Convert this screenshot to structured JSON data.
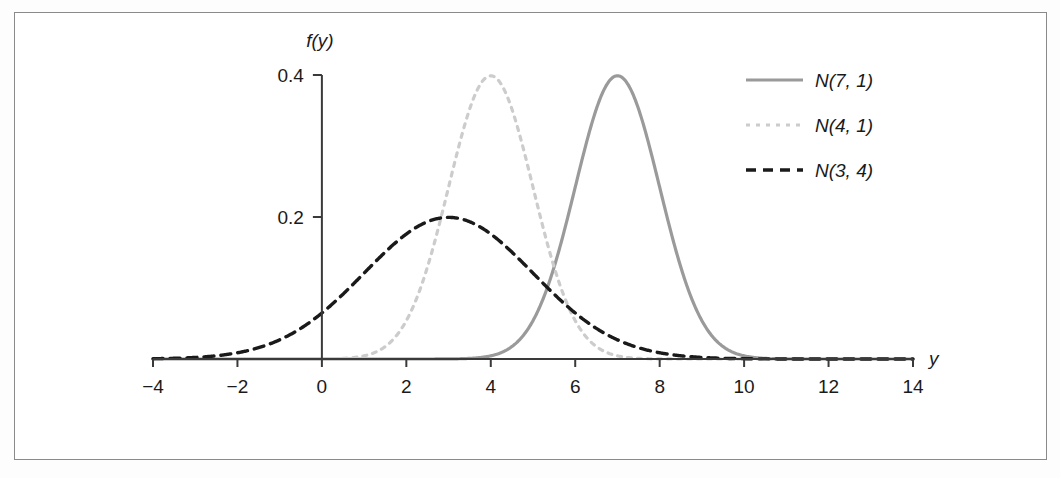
{
  "chart_data": {
    "type": "line",
    "title": "",
    "xlabel": "y",
    "ylabel": "f(y)",
    "xlim": [
      -4,
      14
    ],
    "ylim": [
      0,
      0.42
    ],
    "grid": false,
    "legend_position": "top-right",
    "xticks": [
      "-4",
      "-2",
      "0",
      "2",
      "4",
      "6",
      "8",
      "10",
      "12",
      "14"
    ],
    "xtick_values": [
      -4,
      -2,
      0,
      2,
      4,
      6,
      8,
      10,
      12,
      14
    ],
    "yticks": [
      "0.2",
      "0.4"
    ],
    "ytick_values": [
      0.2,
      0.4
    ],
    "series": [
      {
        "name": "N(7, 1)",
        "mean": 7,
        "variance": 1,
        "sd": 1,
        "peak_value": 0.399,
        "peak_at_x": 7,
        "style": "solid",
        "color": "#9a9a9a",
        "width": 3.2
      },
      {
        "name": "N(4, 1)",
        "mean": 4,
        "variance": 1,
        "sd": 1,
        "peak_value": 0.399,
        "peak_at_x": 4,
        "style": "dotted",
        "color": "#cccccc",
        "width": 3.2
      },
      {
        "name": "N(3, 4)",
        "mean": 3,
        "variance": 4,
        "sd": 2,
        "peak_value": 0.199,
        "peak_at_x": 3,
        "style": "dashed",
        "color": "#1a1a1a",
        "width": 3.4
      }
    ]
  },
  "legend": {
    "entries": [
      {
        "label": "N(7, 1)"
      },
      {
        "label": "N(4, 1)"
      },
      {
        "label": "N(3, 4)"
      }
    ]
  },
  "axes": {
    "y_axis_label": "f(y)",
    "x_axis_label": "y"
  },
  "colors": {
    "frame": "#8a8a8a",
    "axis": "#3a3a3a",
    "background": "#ffffff",
    "series_solid": "#9a9a9a",
    "series_light_dashed": "#cccccc",
    "series_dark_dashed": "#1a1a1a"
  }
}
